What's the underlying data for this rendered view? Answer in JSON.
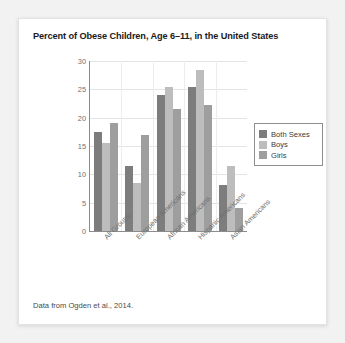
{
  "card": {
    "title": "Percent of Obese Children, Age 6–11, in the United States",
    "caption": "Data from Ogden et al., 2014."
  },
  "colors": {
    "both_sexes": "#7d7d7d",
    "boys": "#bdbdbd",
    "girls": "#9e9e9e",
    "axis": "#8c8c8c",
    "grid": "#e4e4e4",
    "card_background": "#ffffff",
    "page_background": "#f2f2f2"
  },
  "chart_data": {
    "type": "bar",
    "title": "Percent of Obese Children, Age 6–11, in the United States",
    "xlabel": "",
    "ylabel": "",
    "ylim": [
      0,
      30
    ],
    "yticks": [
      0,
      5,
      10,
      15,
      20,
      25,
      30
    ],
    "grid": true,
    "legend_position": "right",
    "categories": [
      "All Groups",
      "European Americans",
      "African Americans",
      "Hispanic Americans",
      "Asian Americans"
    ],
    "series": [
      {
        "name": "Both Sexes",
        "color": "#7d7d7d",
        "values": [
          17.5,
          11.5,
          24.0,
          25.5,
          8.2
        ]
      },
      {
        "name": "Boys",
        "color": "#bdbdbd",
        "values": [
          15.5,
          8.5,
          25.5,
          28.5,
          11.5
        ]
      },
      {
        "name": "Girls",
        "color": "#9e9e9e",
        "values": [
          19.0,
          17.0,
          21.5,
          22.3,
          4.0
        ]
      }
    ]
  }
}
